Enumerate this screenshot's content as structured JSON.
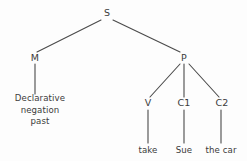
{
  "diagram": {
    "type": "syntax-tree",
    "background_color": "#fdfdfd",
    "line_color": "#4a4a4a",
    "text_color": "#3b3b3b",
    "nodes": [
      {
        "id": "S",
        "label": "S",
        "x": 107,
        "y": 13,
        "kind": "nonterminal"
      },
      {
        "id": "M",
        "label": "M",
        "x": 35,
        "y": 58,
        "kind": "nonterminal"
      },
      {
        "id": "P",
        "label": "P",
        "x": 184,
        "y": 58,
        "kind": "nonterminal"
      },
      {
        "id": "V",
        "label": "V",
        "x": 148,
        "y": 103,
        "kind": "nonterminal"
      },
      {
        "id": "C1",
        "label": "C1",
        "x": 184,
        "y": 103,
        "kind": "nonterminal"
      },
      {
        "id": "C2",
        "label": "C2",
        "x": 222,
        "y": 103,
        "kind": "nonterminal"
      }
    ],
    "leaves": [
      {
        "id": "M-leaf",
        "lines": [
          "Declarative",
          "negation",
          "past"
        ],
        "x": 40,
        "y": 110,
        "kind": "terminal"
      },
      {
        "id": "V-leaf",
        "label": "take",
        "x": 148,
        "y": 150,
        "kind": "terminal"
      },
      {
        "id": "C1-leaf",
        "label": "Sue",
        "x": 184,
        "y": 150,
        "kind": "terminal"
      },
      {
        "id": "C2-leaf",
        "label": "the car",
        "x": 221,
        "y": 150,
        "kind": "terminal"
      }
    ],
    "edges": [
      {
        "from": "S",
        "to": "M",
        "x1": 101,
        "y1": 20,
        "x2": 37,
        "y2": 52
      },
      {
        "from": "S",
        "to": "P",
        "x1": 113,
        "y1": 20,
        "x2": 180,
        "y2": 52
      },
      {
        "from": "M",
        "to": "M-leaf",
        "x1": 35,
        "y1": 64,
        "x2": 35,
        "y2": 94
      },
      {
        "from": "P",
        "to": "V",
        "x1": 180,
        "y1": 64,
        "x2": 150,
        "y2": 97
      },
      {
        "from": "P",
        "to": "C1",
        "x1": 184,
        "y1": 64,
        "x2": 184,
        "y2": 97
      },
      {
        "from": "P",
        "to": "C2",
        "x1": 189,
        "y1": 64,
        "x2": 219,
        "y2": 97
      },
      {
        "from": "V",
        "to": "V-leaf",
        "x1": 148,
        "y1": 110,
        "x2": 148,
        "y2": 143
      },
      {
        "from": "C1",
        "to": "C1-leaf",
        "x1": 184,
        "y1": 110,
        "x2": 184,
        "y2": 143
      },
      {
        "from": "C2",
        "to": "C2-leaf",
        "x1": 221,
        "y1": 110,
        "x2": 221,
        "y2": 143
      }
    ]
  }
}
